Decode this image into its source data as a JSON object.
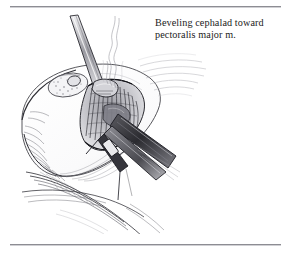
{
  "page": {
    "background_color": "#ffffff",
    "rule_color": "#8d8d93",
    "ink_color": "#1b1b1b"
  },
  "caption": {
    "text": "Beveling cephalad toward\npectoralis major m.",
    "line1": "Beveling cephalad toward",
    "line2": "pectoralis major m."
  },
  "rules": {
    "top_label": "top-rule",
    "bottom_label": "bottom-rule"
  },
  "illustration": {
    "title": "Surgical line drawing: beveling cephalad toward pectoralis major muscle",
    "style": "pen-and-ink hatched medical illustration",
    "elements": [
      "breast-mound",
      "areola",
      "incision-opening",
      "retractor",
      "electrocautery-instrument",
      "cautery-smoke-plume",
      "drape-folds",
      "tissue-hatching"
    ]
  }
}
